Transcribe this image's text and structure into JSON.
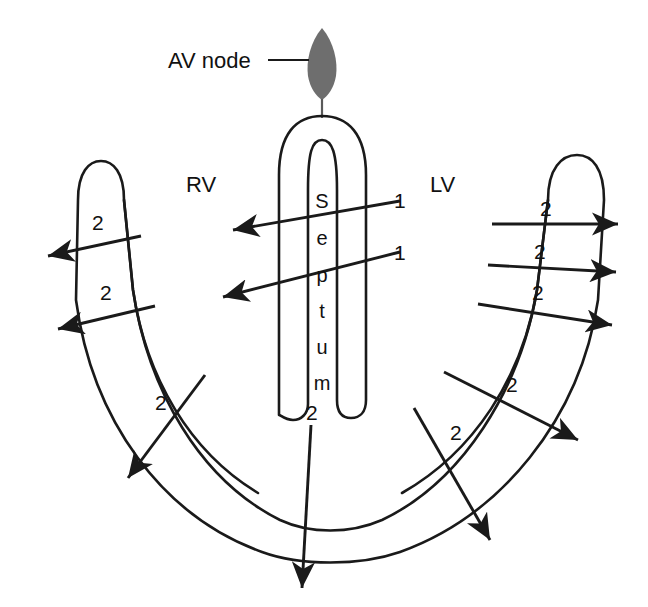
{
  "figure": {
    "background_color": "#ffffff",
    "line_color": "#1a1a1a",
    "node_color": "#6e6e6e"
  },
  "labels": {
    "av_node": "AV node",
    "rv": "RV",
    "lv": "LV",
    "septum_letters": [
      "S",
      "e",
      "p",
      "t",
      "u",
      "m"
    ],
    "septum_word": "Septum"
  },
  "sequence_markers": {
    "septal": "1",
    "free_wall": "2"
  },
  "arrows": {
    "septal": [
      {
        "label": "1",
        "direction": "right-to-left",
        "region": "septum-upper"
      },
      {
        "label": "1",
        "direction": "right-to-left",
        "region": "septum-lower"
      }
    ],
    "rv_free_wall": [
      {
        "label": "2",
        "direction": "leftward-outward",
        "region": "rv-upper"
      },
      {
        "label": "2",
        "direction": "leftward-outward",
        "region": "rv-mid"
      },
      {
        "label": "2",
        "direction": "down-left-outward",
        "region": "rv-apical"
      }
    ],
    "lv_free_wall": [
      {
        "label": "2",
        "direction": "rightward-outward",
        "region": "lv-upper"
      },
      {
        "label": "2",
        "direction": "rightward-outward",
        "region": "lv-mid"
      },
      {
        "label": "2",
        "direction": "rightward-outward",
        "region": "lv-lower"
      },
      {
        "label": "2",
        "direction": "down-right-outward",
        "region": "lv-apical-upper"
      },
      {
        "label": "2",
        "direction": "down-right-outward",
        "region": "lv-apical-lower"
      }
    ],
    "apex": [
      {
        "label": "2",
        "direction": "downward",
        "region": "apex"
      }
    ]
  }
}
